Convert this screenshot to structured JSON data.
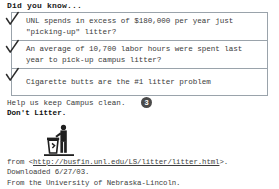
{
  "heading": "Did you know...",
  "facts": [
    {
      "check_icon": "checkmark-icon",
      "lines": [
        "UNL spends in excess of $180,000 per year just",
        "\"picking-up\" litter?"
      ]
    },
    {
      "check_icon": "checkmark-icon",
      "lines": [
        "An average of 10,700 labor hours were spent last",
        "year to pick-up campus litter?"
      ]
    },
    {
      "check_icon": "checkmark-icon",
      "lines": [
        "Cigarette butts are the #1 litter problem"
      ]
    }
  ],
  "help": {
    "line1": "Help us keep Campus clean.",
    "line2": "Don't Litter.",
    "badge": "3"
  },
  "pictogram": {
    "icon": "person-using-trash-can-icon"
  },
  "source": {
    "prefix": "from <",
    "url": "http://busfin.unl.edu/LS/litter/litter.html",
    "suffix": ">.",
    "downloaded": "Downloaded 6/27/03.",
    "attribution": "From the University of Nebraska-Lincoln."
  },
  "colors": {
    "box_border": "#9aa3ab",
    "badge_background": "#4a4a4a",
    "text": "#3a3a3a"
  }
}
